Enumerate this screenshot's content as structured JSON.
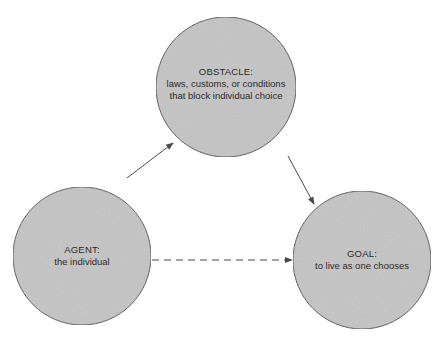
{
  "diagram": {
    "type": "triangle-relationship",
    "colors": {
      "background": "#ffffff",
      "node_fill": "#c4c4c4",
      "node_stroke": "#5a5a5a",
      "edge": "#4a4a4a",
      "text": "#2a2a2a"
    },
    "nodes": [
      {
        "id": "obstacle",
        "title": "OBSTACLE:",
        "lines": [
          "laws, customs, or conditions",
          "that block individual choice"
        ],
        "cx": 226,
        "cy": 87,
        "r": 70
      },
      {
        "id": "agent",
        "title": "AGENT:",
        "lines": [
          "the individual"
        ],
        "cx": 82,
        "cy": 256,
        "r": 69
      },
      {
        "id": "goal",
        "title": "GOAL:",
        "lines": [
          "to live as one chooses"
        ],
        "cx": 362,
        "cy": 260,
        "r": 69
      }
    ],
    "edges": [
      {
        "from": "agent",
        "to": "obstacle",
        "style": "solid",
        "arrow": "end"
      },
      {
        "from": "obstacle",
        "to": "goal",
        "style": "solid",
        "arrow": "end"
      },
      {
        "from": "agent",
        "to": "goal",
        "style": "dashed",
        "arrow": "end"
      }
    ]
  }
}
